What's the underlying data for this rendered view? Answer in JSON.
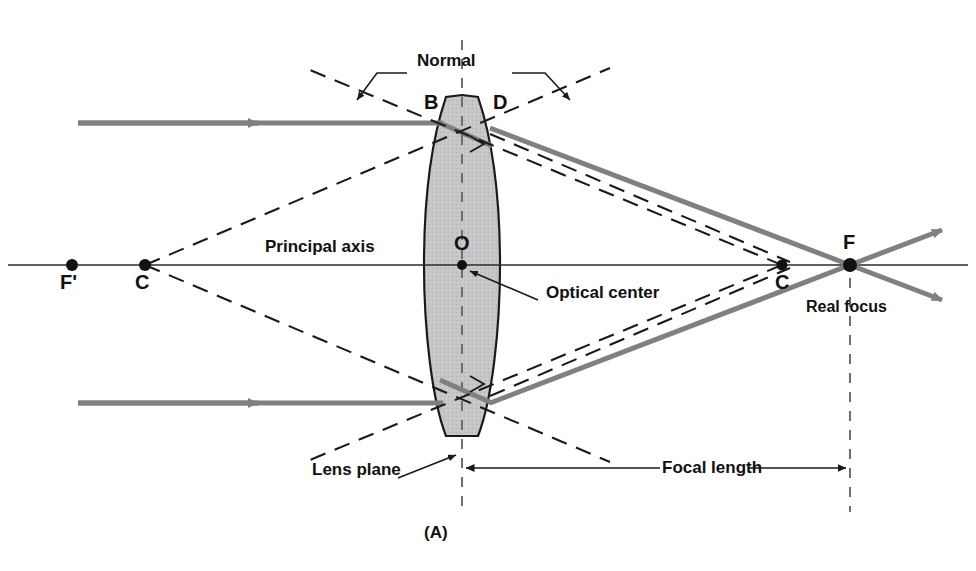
{
  "figure": {
    "caption": "(A)",
    "title_labels": {
      "normal": "Normal",
      "principal_axis": "Principal axis",
      "optical_center": "Optical center",
      "lens_plane": "Lens plane",
      "focal_length": "Focal length",
      "real_focus": "Real focus"
    },
    "points": [
      {
        "id": "F-prime",
        "label": "F'",
        "x": 72,
        "y": 265,
        "dot": 6,
        "label_x": 62,
        "label_y": 275
      },
      {
        "id": "C-left",
        "label": "C",
        "x": 145,
        "y": 265,
        "dot": 6,
        "label_x": 137,
        "label_y": 275
      },
      {
        "id": "B",
        "label": "B",
        "x": 440,
        "y": 123,
        "dot": 0,
        "label_x": 425,
        "label_y": 93
      },
      {
        "id": "D",
        "label": "D",
        "x": 490,
        "y": 123,
        "dot": 0,
        "label_x": 492,
        "label_y": 93
      },
      {
        "id": "O",
        "label": "O",
        "x": 462,
        "y": 265,
        "dot": 5,
        "label_x": 455,
        "label_y": 234
      },
      {
        "id": "C-right",
        "label": "C",
        "x": 782,
        "y": 265,
        "dot": 5,
        "label_x": 775,
        "label_y": 275
      },
      {
        "id": "F",
        "label": "F",
        "x": 850,
        "y": 265,
        "dot": 7,
        "label_x": 843,
        "label_y": 233
      }
    ],
    "colors": {
      "ray": "#808080",
      "lens_fill": "#c4c4c4",
      "lens_stroke": "#1a1a1a",
      "axis": "#2b2b2b",
      "dashed": "#1a1a1a",
      "text": "#111111"
    },
    "geometry": {
      "axis_y": 265,
      "upper_ray_y": 123,
      "lower_ray_y": 403,
      "lens_top_y": 95,
      "lens_bottom_y": 440,
      "lens_center_x": 462,
      "lens_half_width": 38,
      "ray_start_x": 78,
      "focus_x": 850,
      "focal_length_px": 388
    }
  }
}
